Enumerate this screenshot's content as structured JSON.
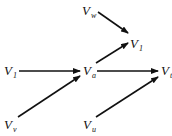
{
  "diagram": {
    "type": "directed-graph",
    "nodes": [
      {
        "id": "Vw",
        "base": "V",
        "sub": "w",
        "x": 82,
        "y": 4
      },
      {
        "id": "V1",
        "base": "V",
        "sub": "1",
        "x": 130,
        "y": 37
      },
      {
        "id": "Vs",
        "base": "V",
        "sub": "1",
        "x": 4,
        "y": 64
      },
      {
        "id": "Va",
        "base": "V",
        "sub": "a",
        "x": 83,
        "y": 64
      },
      {
        "id": "Vt",
        "base": "V",
        "sub": "t",
        "x": 161,
        "y": 64
      },
      {
        "id": "Vv",
        "base": "V",
        "sub": "v",
        "x": 4,
        "y": 118
      },
      {
        "id": "Vu",
        "base": "V",
        "sub": "u",
        "x": 83,
        "y": 118
      }
    ],
    "edges": [
      {
        "from": "Vw",
        "to": "V1"
      },
      {
        "from": "Va",
        "to": "V1"
      },
      {
        "from": "Vs",
        "to": "Va"
      },
      {
        "from": "Vv",
        "to": "Va"
      },
      {
        "from": "Va",
        "to": "Vt"
      },
      {
        "from": "Vu",
        "to": "Vt"
      }
    ],
    "colors": {
      "ink": "#111111",
      "background": "#ffffff"
    }
  }
}
